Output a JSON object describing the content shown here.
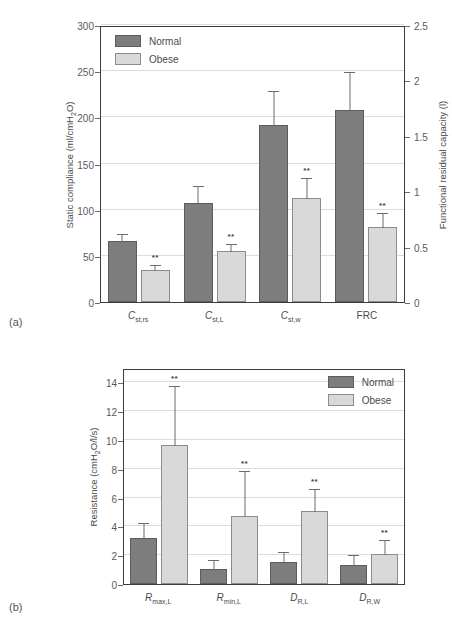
{
  "figure": {
    "panels": [
      {
        "tag": "(a)"
      },
      {
        "tag": "(b)"
      }
    ]
  },
  "legend": {
    "normal_label": "Normal",
    "obese_label": "Obese",
    "normal_color": "#7d7d7d",
    "obese_color": "#d9d9d9"
  },
  "chart_data": [
    {
      "type": "bar",
      "panel": "(a)",
      "title": "",
      "categories": [
        "C_st,rs",
        "C_st,L",
        "C_st,w",
        "FRC"
      ],
      "category_labels_html": [
        "C<sub>st,rs</sub>",
        "C<sub>st,L</sub>",
        "C<sub>st,w</sub>",
        "FRC"
      ],
      "series": [
        {
          "name": "Normal",
          "values": [
            66,
            107,
            192,
            208
          ],
          "errors": [
            9,
            20,
            38,
            42
          ]
        },
        {
          "name": "Obese",
          "values": [
            35,
            55,
            113,
            81
          ],
          "errors": [
            6,
            9,
            22,
            17
          ]
        }
      ],
      "significance": [
        {
          "category": "C_st,rs",
          "series": "Obese",
          "marker": "**"
        },
        {
          "category": "C_st,L",
          "series": "Obese",
          "marker": "**"
        },
        {
          "category": "C_st,w",
          "series": "Obese",
          "marker": "**"
        },
        {
          "category": "FRC",
          "series": "Obese",
          "marker": "**"
        }
      ],
      "xlabel": "",
      "ylabel": "Static compliance (ml/cmH2O)",
      "ylabel_html": "Static compliance (ml/cmH<sub>2</sub>O)",
      "ylim": [
        0,
        300
      ],
      "yticks": [
        0,
        50,
        100,
        150,
        200,
        250,
        300
      ],
      "y2label": "Functional residual capacity (l)",
      "y2lim": [
        0,
        2.5
      ],
      "y2ticks": [
        "0",
        "0.5",
        "1",
        "1.5",
        "2",
        "2.5"
      ],
      "grid": true,
      "legend_position": "top-left"
    },
    {
      "type": "bar",
      "panel": "(b)",
      "title": "",
      "categories": [
        "R_max,L",
        "R_min,L",
        "D_R,L",
        "D_R,W"
      ],
      "category_labels_html": [
        "R<sub>max,L</sub>",
        "R<sub>min,L</sub>",
        "D<sub>R,L</sub>",
        "D<sub>R,W</sub>"
      ],
      "series": [
        {
          "name": "Normal",
          "values": [
            3.2,
            1.05,
            1.55,
            1.3
          ],
          "errors": [
            1.1,
            0.7,
            0.75,
            0.8
          ]
        },
        {
          "name": "Obese",
          "values": [
            9.65,
            4.75,
            5.05,
            2.05
          ],
          "errors": [
            4.15,
            3.2,
            1.65,
            1.1
          ]
        }
      ],
      "significance": [
        {
          "category": "R_max,L",
          "series": "Obese",
          "marker": "**"
        },
        {
          "category": "R_min,L",
          "series": "Obese",
          "marker": "**"
        },
        {
          "category": "D_R,L",
          "series": "Obese",
          "marker": "**"
        },
        {
          "category": "D_R,W",
          "series": "Obese",
          "marker": "**"
        }
      ],
      "xlabel": "",
      "ylabel": "Resistance (cmH2O/l/s)",
      "ylabel_html": "Resistance (cmH<sub>2</sub>O/l/s)",
      "ylim": [
        0,
        15
      ],
      "yticks": [
        0,
        2,
        4,
        6,
        8,
        10,
        12,
        14
      ],
      "grid": true,
      "legend_position": "top-right"
    }
  ]
}
